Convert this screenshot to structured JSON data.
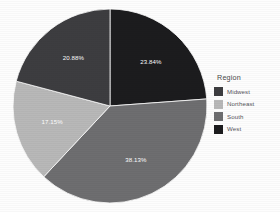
{
  "chart_data": {
    "type": "pie",
    "title": "",
    "legend_title": "Region",
    "legend_position": "right",
    "categories": [
      "West",
      "South",
      "Northeast",
      "Midwest"
    ],
    "values": [
      23.84,
      38.13,
      17.15,
      20.88
    ],
    "value_unit": "%",
    "start_angle_deg": 0,
    "direction": "clockwise",
    "slices": [
      {
        "label": "West",
        "value": 23.84,
        "display": "23.84%",
        "color": "#1c1c1e"
      },
      {
        "label": "South",
        "value": 38.13,
        "display": "38.13%",
        "color": "#6e6e70"
      },
      {
        "label": "Northeast",
        "value": 17.15,
        "display": "17.15%",
        "color": "#b8b8b8"
      },
      {
        "label": "Midwest",
        "value": 20.88,
        "display": "20.88%",
        "color": "#3d3d40"
      }
    ],
    "legend_entries": [
      {
        "label": "Midwest",
        "color": "#3d3d40"
      },
      {
        "label": "Northeast",
        "color": "#b8b8b8"
      },
      {
        "label": "South",
        "color": "#6e6e70"
      },
      {
        "label": "West",
        "color": "#1c1c1e"
      }
    ],
    "label_text_color": "#ffffff",
    "background_color": "#fdfdfd"
  }
}
